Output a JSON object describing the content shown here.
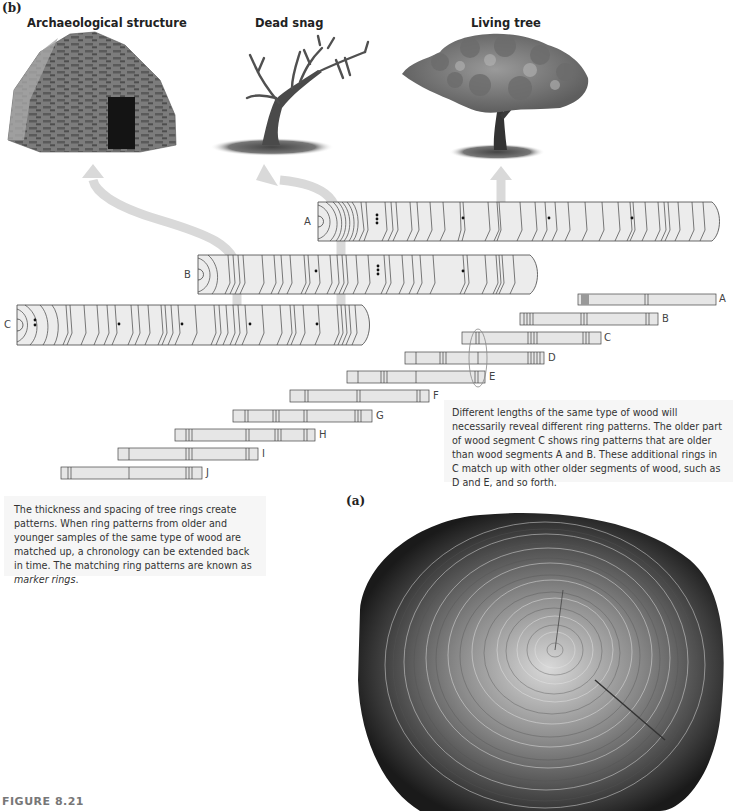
{
  "figure": {
    "number_label": "FIGURE 8.21",
    "panel_b_label": "(b)",
    "panel_a_label": "(a)"
  },
  "sources": [
    {
      "id": "archaeological",
      "title": "Archaeological structure",
      "icon": "stone-hut-image"
    },
    {
      "id": "snag",
      "title": "Dead snag",
      "icon": "dead-tree-image"
    },
    {
      "id": "living",
      "title": "Living tree",
      "icon": "living-tree-image"
    }
  ],
  "cores": [
    {
      "label": "A",
      "source": "Living tree"
    },
    {
      "label": "B",
      "source": "Dead snag"
    },
    {
      "label": "C",
      "source": "Archaeological structure"
    }
  ],
  "strips": [
    {
      "label": "A"
    },
    {
      "label": "B"
    },
    {
      "label": "C"
    },
    {
      "label": "D"
    },
    {
      "label": "E"
    },
    {
      "label": "F"
    },
    {
      "label": "G"
    },
    {
      "label": "H"
    },
    {
      "label": "I"
    },
    {
      "label": "J"
    }
  ],
  "captions": {
    "right": "Different lengths of the same type of wood will necessarily reveal different ring patterns. The older part of wood segment C shows ring patterns that are older than wood segments A and B. These additional rings in C match up with other older segments of wood, such as D and E, and so forth.",
    "left_main": "The thickness and spacing of tree rings create patterns. When ring patterns from older and younger samples of the same type of wood are matched up, a chronology can be extended back in time. The matching ring patterns are known as ",
    "left_em": "marker rings",
    "left_end": "."
  },
  "colors": {
    "arrow": "#d9d9d9",
    "core_fill": "#ebebeb",
    "strip_fill": "#e6e6e6",
    "caption_bg": "#f6f6f6",
    "line": "#444444"
  }
}
